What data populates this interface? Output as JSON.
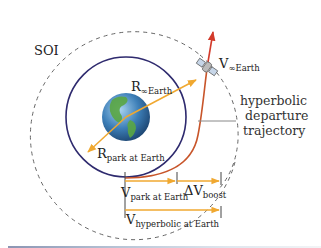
{
  "diagram": {
    "labels": {
      "soi": "SOI",
      "r_inf": {
        "main": "R",
        "sub": "∞Earth"
      },
      "v_inf": {
        "main": "V",
        "sub": "∞Earth"
      },
      "r_park": {
        "main": "R",
        "sub": "park at Earth"
      },
      "v_park": {
        "main": "V",
        "sub": "park at Earth"
      },
      "dv_boost": {
        "main": "ΔV",
        "sub": "boost"
      },
      "v_hyper": {
        "main": "V",
        "sub": "hyperbolic at Earth"
      },
      "trajectory_line1": "hyperbolic",
      "trajectory_line2": "departure",
      "trajectory_line3": "trajectory"
    },
    "colors": {
      "soi_dashed": "#666666",
      "parking_orbit": "#2e2a6e",
      "hyperbolic_path": "#c8552a",
      "velocity_arrow": "#d23a2a",
      "radius_arrows": "#f0a830",
      "ocean": "#3d7fb8",
      "land": "#5aa642"
    }
  }
}
